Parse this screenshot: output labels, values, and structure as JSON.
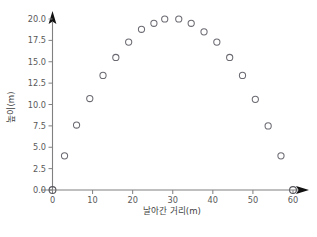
{
  "chart_data": {
    "type": "scatter",
    "title": "",
    "xlabel": "날아간 거리(m)",
    "ylabel": "높이(m)",
    "xlim": [
      0,
      60
    ],
    "ylim": [
      0,
      20
    ],
    "grid": false,
    "legend": null,
    "xticks": [
      0,
      10,
      20,
      30,
      40,
      50,
      60
    ],
    "xtick_labels": [
      "0",
      "10",
      "20",
      "30",
      "40",
      "50",
      "60"
    ],
    "yticks": [
      0.0,
      2.5,
      5.0,
      7.5,
      10.0,
      12.5,
      15.0,
      17.5,
      20.0
    ],
    "ytick_labels": [
      "0.0",
      "2.5",
      "5.0",
      "7.5",
      "10.0",
      "12.5",
      "15.0",
      "17.5",
      "20.0"
    ],
    "series": [
      {
        "name": "궤적",
        "marker": "open-circle",
        "color": "#6a6a72",
        "x": [
          3.0,
          6.0,
          9.3,
          12.6,
          15.8,
          19.0,
          22.2,
          25.3,
          28.0,
          31.5,
          34.6,
          37.8,
          41.0,
          44.2,
          47.4,
          50.6,
          53.8,
          57.0
        ],
        "y": [
          4.0,
          7.6,
          10.7,
          13.4,
          15.5,
          17.3,
          18.8,
          19.5,
          20.0,
          20.0,
          19.5,
          18.5,
          17.3,
          15.5,
          13.4,
          10.6,
          7.5,
          4.0
        ]
      }
    ],
    "endpoints": [
      {
        "name": "origin-marker",
        "x": 0,
        "y": 0
      },
      {
        "name": "landing-marker",
        "x": 60,
        "y": 0
      }
    ],
    "axis_arrows": {
      "x": "right",
      "y": "up"
    }
  },
  "figure": {
    "caption": ""
  }
}
